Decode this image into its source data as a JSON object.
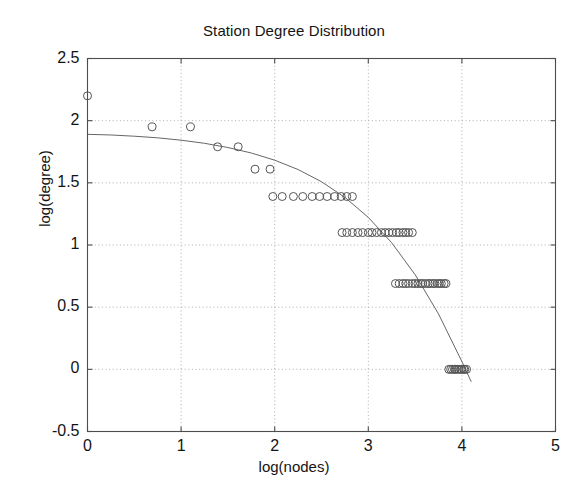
{
  "chart_data": {
    "type": "scatter",
    "title": "Station Degree Distribution",
    "xlabel": "log(nodes)",
    "ylabel": "log(degree)",
    "xlim": [
      0,
      5
    ],
    "ylim": [
      -0.5,
      2.5
    ],
    "xticks": [
      "0",
      "1",
      "2",
      "3",
      "4",
      "5"
    ],
    "xtick_values": [
      0,
      1,
      2,
      3,
      4,
      5
    ],
    "yticks": [
      "-0.5",
      "0",
      "0.5",
      "1",
      "1.5",
      "2",
      "2.5"
    ],
    "ytick_values": [
      -0.5,
      0,
      0.5,
      1,
      1.5,
      2,
      2.5
    ],
    "grid": "dotted",
    "legend": "none",
    "marker": "open-circle",
    "marker_color": "#555555",
    "fit_line_color": "#666666",
    "series": [
      {
        "name": "observed degrees",
        "type": "scatter",
        "x": [
          0.0,
          0.69,
          1.1,
          1.39,
          1.61,
          1.79,
          1.95,
          1.98,
          2.08,
          2.2,
          2.3,
          2.4,
          2.48,
          2.56,
          2.64,
          2.71,
          2.77,
          2.83,
          2.72,
          2.77,
          2.83,
          2.89,
          2.94,
          3.0,
          3.04,
          3.09,
          3.14,
          3.18,
          3.22,
          3.26,
          3.3,
          3.33,
          3.37,
          3.4,
          3.43,
          3.47,
          3.29,
          3.33,
          3.37,
          3.4,
          3.43,
          3.47,
          3.5,
          3.53,
          3.56,
          3.58,
          3.61,
          3.64,
          3.66,
          3.69,
          3.71,
          3.74,
          3.76,
          3.78,
          3.81,
          3.83,
          3.86,
          3.88,
          3.9,
          3.92,
          3.93,
          3.95,
          3.97,
          3.99,
          4.0,
          4.02,
          4.03,
          4.05
        ],
        "y": [
          2.2,
          1.95,
          1.95,
          1.79,
          1.79,
          1.61,
          1.61,
          1.39,
          1.39,
          1.39,
          1.39,
          1.39,
          1.39,
          1.39,
          1.39,
          1.39,
          1.39,
          1.39,
          1.1,
          1.1,
          1.1,
          1.1,
          1.1,
          1.1,
          1.1,
          1.1,
          1.1,
          1.1,
          1.1,
          1.1,
          1.1,
          1.1,
          1.1,
          1.1,
          1.1,
          1.1,
          0.69,
          0.69,
          0.69,
          0.69,
          0.69,
          0.69,
          0.69,
          0.69,
          0.69,
          0.69,
          0.69,
          0.69,
          0.69,
          0.69,
          0.69,
          0.69,
          0.69,
          0.69,
          0.69,
          0.69,
          0.0,
          0.0,
          0.0,
          0.0,
          0.0,
          0.0,
          0.0,
          0.0,
          0.0,
          0.0,
          0.0,
          0.0
        ]
      },
      {
        "name": "fitted curve",
        "type": "line",
        "x": [
          0.0,
          0.25,
          0.5,
          0.75,
          1.0,
          1.25,
          1.5,
          1.75,
          2.0,
          2.25,
          2.5,
          2.75,
          3.0,
          3.25,
          3.5,
          3.75,
          4.0,
          4.1
        ],
        "y": [
          1.89,
          1.885,
          1.875,
          1.862,
          1.843,
          1.818,
          1.784,
          1.74,
          1.682,
          1.607,
          1.509,
          1.383,
          1.222,
          1.018,
          0.762,
          0.446,
          0.062,
          -0.1
        ]
      }
    ]
  },
  "figure": {
    "background_color": "#ffffff",
    "axes_color": "#4d4d4d",
    "grid_color": "#999999"
  }
}
